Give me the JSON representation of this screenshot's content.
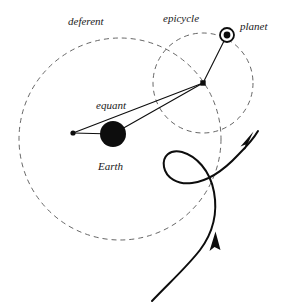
{
  "figure": {
    "background_color": "#ffffff",
    "ink_color": "#0d0d0d",
    "dashed_color": "#555555",
    "width": 288,
    "height": 307
  },
  "labels": {
    "deferent": "deferent",
    "epicycle": "epicycle",
    "planet": "planet",
    "equant": "equant",
    "earth": "Earth"
  },
  "geometry": {
    "deferent_circle": {
      "cx": 120,
      "cy": 139,
      "r": 101,
      "style": "dashed"
    },
    "epicycle_circle": {
      "cx": 203,
      "cy": 83,
      "r": 50,
      "style": "dashed"
    },
    "earth": {
      "cx": 113,
      "cy": 134,
      "r": 13,
      "style": "filled"
    },
    "equant_point": {
      "cx": 73,
      "cy": 133,
      "r": 2.6,
      "style": "filled"
    },
    "epicycle_center": {
      "cx": 203,
      "cy": 83,
      "size": 3.4,
      "style": "filled-square"
    },
    "planet": {
      "cx": 227,
      "cy": 35,
      "ring_r": 7,
      "core_r": 3.4,
      "style": "ring-with-core"
    }
  },
  "connectors": [
    {
      "name": "equant-to-earth",
      "from": [
        73,
        133
      ],
      "to": [
        113,
        134
      ]
    },
    {
      "name": "equant-to-epicycle-center",
      "from": [
        73,
        133
      ],
      "to": [
        203,
        83
      ]
    },
    {
      "name": "earth-to-epicycle-center",
      "from": [
        113,
        134
      ],
      "to": [
        203,
        83
      ]
    },
    {
      "name": "epicycle-center-to-planet",
      "from": [
        203,
        83
      ],
      "to": [
        227,
        35
      ]
    }
  ],
  "apparent_path": {
    "name": "retrograde-loop-path",
    "description": "Looping apparent path of the planet as seen from Earth, with two direction arrowheads",
    "arrowheads": [
      {
        "name": "upper-arrowhead",
        "at": [
          249,
          139
        ],
        "direction": "up-right"
      },
      {
        "name": "lower-arrowhead",
        "at": [
          217,
          243
        ],
        "direction": "up"
      }
    ]
  },
  "label_positions": {
    "deferent": [
      68,
      25
    ],
    "epicycle": [
      163,
      22
    ],
    "planet": [
      240,
      30
    ],
    "equant": [
      96,
      109
    ],
    "earth": [
      98,
      170
    ]
  }
}
